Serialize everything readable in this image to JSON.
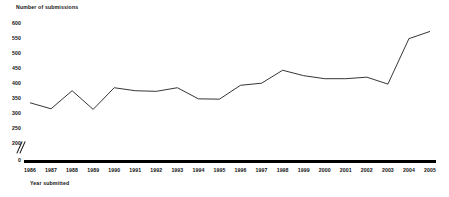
{
  "chart_data": {
    "type": "line",
    "title": "",
    "ylabel": "Number of submissions",
    "xlabel": "Year submitted",
    "categories": [
      "1986",
      "1987",
      "1988",
      "1989",
      "1990",
      "1991",
      "1992",
      "1993",
      "1994",
      "1995",
      "1996",
      "1997",
      "1998",
      "1999",
      "2000",
      "2001",
      "2002",
      "2003",
      "2004",
      "2005"
    ],
    "values": [
      335,
      315,
      375,
      313,
      385,
      375,
      373,
      385,
      348,
      347,
      393,
      400,
      443,
      425,
      415,
      415,
      420,
      397,
      548,
      572
    ],
    "series": [
      {
        "name": "Number of submissions",
        "values": [
          335,
          315,
          375,
          313,
          385,
          375,
          373,
          385,
          348,
          347,
          393,
          400,
          443,
          425,
          415,
          415,
          420,
          397,
          548,
          572
        ]
      }
    ],
    "ytick_labels": [
      "600",
      "550",
      "500",
      "450",
      "400",
      "350",
      "300",
      "250",
      "200",
      "0"
    ],
    "ytick_values": [
      600,
      550,
      500,
      450,
      400,
      350,
      300,
      250,
      200,
      0
    ],
    "ylim": [
      200,
      600
    ],
    "y_axis_break": true,
    "y_axis_break_symbol": "//",
    "grid": false,
    "legend": false,
    "legend_position": "none",
    "line_color": "#2b2b2b",
    "background_color": "#ffffff"
  }
}
